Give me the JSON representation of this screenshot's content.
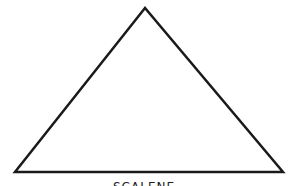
{
  "diagram": {
    "shape": "triangle",
    "stroke_color": "#1a1a1a",
    "fill_color": "#ffffff",
    "vertices": [
      [
        145,
        8
      ],
      [
        15,
        172
      ],
      [
        283,
        172
      ]
    ],
    "caption": "SCALENE"
  }
}
